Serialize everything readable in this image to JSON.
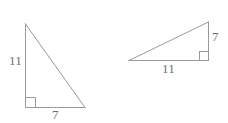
{
  "figure": {
    "background_color": "#ffffff",
    "stroke_color": "#9a9a9a",
    "label_color": "#6f6f6f",
    "triangles": [
      {
        "id": "left-triangle",
        "name": "left-right-triangle",
        "orientation": "vertical-leg-left",
        "right_angle_corner": "bottom-left",
        "vertices": {
          "apex": [
            25,
            24
          ],
          "right_angle": [
            25,
            107
          ],
          "base_end": [
            85,
            108
          ]
        },
        "labels": {
          "vertical_leg": "11",
          "horizontal_leg": "7"
        }
      },
      {
        "id": "right-triangle",
        "name": "right-right-triangle",
        "orientation": "vertical-leg-right",
        "right_angle_corner": "bottom-right",
        "vertices": {
          "apex": [
            209,
            22
          ],
          "right_angle": [
            209,
            60
          ],
          "base_end": [
            129,
            60
          ]
        },
        "labels": {
          "vertical_leg": "7",
          "horizontal_leg": "11"
        }
      }
    ]
  }
}
